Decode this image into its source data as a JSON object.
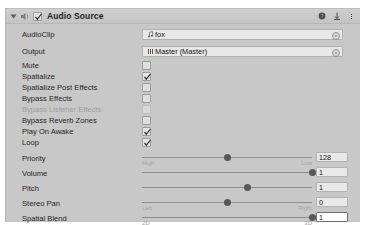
{
  "header": {
    "title": "Audio Source",
    "enabled_checkbox": true,
    "foldout_expanded": true,
    "icons": [
      "audio-source-icon",
      "help-icon",
      "preset-icon",
      "more-menu-icon"
    ]
  },
  "properties": {
    "audio_clip": {
      "label": "AudioClip",
      "value": "fox",
      "icon": "music-note-icon"
    },
    "output": {
      "label": "Output",
      "value": "Master (Master)",
      "icon": "audio-mixer-icon"
    },
    "toggles": [
      {
        "label": "Mute",
        "checked": false,
        "disabled": false
      },
      {
        "label": "Spatialize",
        "checked": true,
        "disabled": false
      },
      {
        "label": "Spatialize Post Effects",
        "checked": false,
        "disabled": false
      },
      {
        "label": "Bypass Effects",
        "checked": false,
        "disabled": false
      },
      {
        "label": "Bypass Listener Effects",
        "checked": false,
        "disabled": true
      },
      {
        "label": "Bypass Reverb Zones",
        "checked": false,
        "disabled": false
      },
      {
        "label": "Play On Awake",
        "checked": true,
        "disabled": false
      },
      {
        "label": "Loop",
        "checked": true,
        "disabled": false
      }
    ],
    "sliders": [
      {
        "label": "Priority",
        "value": "128",
        "fraction": 0.5,
        "min_label": "High",
        "max_label": "Low",
        "focused": false
      },
      {
        "label": "Volume",
        "value": "1",
        "fraction": 1.0,
        "min_label": "",
        "max_label": "",
        "focused": false
      },
      {
        "label": "Pitch",
        "value": "1",
        "fraction": 0.62,
        "min_label": "",
        "max_label": "",
        "focused": false
      },
      {
        "label": "Stereo Pan",
        "value": "0",
        "fraction": 0.5,
        "min_label": "Left",
        "max_label": "Right",
        "focused": false
      },
      {
        "label": "Spatial Blend",
        "value": "1",
        "fraction": 1.0,
        "min_label": "2D",
        "max_label": "3D",
        "focused": true
      }
    ]
  },
  "colors": {
    "panel_bg": "#c8c8c8",
    "header_bg": "#cbcbcb",
    "field_bg": "#e8e8e8",
    "text": "#1f1f1f",
    "disabled_text": "#9f9f9f",
    "handle": "#585858",
    "track": "#8f8f8f"
  }
}
